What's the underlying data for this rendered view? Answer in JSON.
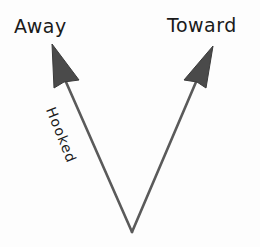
{
  "diagram": {
    "title": "",
    "labels": {
      "away": "Away",
      "toward": "Toward",
      "hooked": "Hooked"
    },
    "arrows": [
      {
        "name": "away-arrow",
        "from": "vertex",
        "to": "Away",
        "annotation": "Hooked"
      },
      {
        "name": "toward-arrow",
        "from": "vertex",
        "to": "Toward",
        "annotation": ""
      }
    ],
    "colors": {
      "stroke": "#5a5a5a",
      "arrowhead": "#4a4a4a",
      "text": "#1a1a1a",
      "background": "#fdfdfd"
    }
  }
}
